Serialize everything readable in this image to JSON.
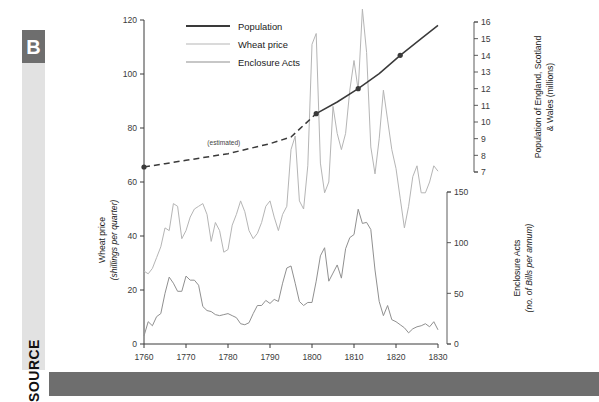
{
  "source_rail": {
    "letter": "B",
    "word": "SOURCE"
  },
  "colors": {
    "population": "#3a3a3a",
    "wheat": "#b5b5b5",
    "enclosure": "#909090",
    "rail_bg": "#e2e2e2",
    "rail_letter_bg": "#6e6e6e",
    "bottom_bar": "#6e6e6e",
    "axis": "#3a3a3a",
    "background": "#ffffff"
  },
  "legend": {
    "position": "top-left-inside",
    "items": [
      {
        "label": "Population",
        "color": "#3a3a3a"
      },
      {
        "label": "Wheat price",
        "color": "#b5b5b5"
      },
      {
        "label": "Enclosure Acts",
        "color": "#909090"
      }
    ]
  },
  "annotations": [
    {
      "name": "estimated-note",
      "text": "(estimated)",
      "x": 1779,
      "axis": "population"
    }
  ],
  "axes": {
    "x": {
      "label": "",
      "min": 1760,
      "max": 1830,
      "ticks": [
        1760,
        1770,
        1780,
        1790,
        1800,
        1810,
        1820,
        1830
      ],
      "tick_labels": [
        "1760",
        "1770",
        "1780",
        "1790",
        "1800",
        "1810",
        "1820",
        "1830"
      ]
    },
    "y_left": {
      "label_line1": "Wheat price",
      "label_line2": "(shillings per quarter)",
      "min": 0,
      "max": 120,
      "ticks": [
        0,
        20,
        40,
        60,
        80,
        100,
        120
      ],
      "tick_labels": [
        "0",
        "20",
        "40",
        "60",
        "80",
        "100",
        "120"
      ]
    },
    "y_right_top": {
      "label_line1": "Population of England, Scotland",
      "label_line2": "& Wales (millions)",
      "min": 7,
      "max": 16,
      "ticks": [
        7,
        8,
        9,
        10,
        11,
        12,
        13,
        14,
        15,
        16
      ],
      "tick_labels": [
        "7",
        "8",
        "9",
        "10",
        "11",
        "12",
        "13",
        "14",
        "15",
        "16"
      ]
    },
    "y_right_bottom": {
      "label_line1": "Enclosure Acts",
      "label_line2": "(no. of Bills per annum)",
      "min": 0,
      "max": 150,
      "ticks": [
        0,
        50,
        100,
        150
      ],
      "tick_labels": [
        "0",
        "50",
        "100",
        "150"
      ]
    }
  },
  "chart_data": {
    "type": "line",
    "title": "",
    "xlabel": "",
    "ylabel": "Wheat price (shillings per quarter)",
    "xlim": [
      1760,
      1830
    ],
    "ylim": [
      0,
      120
    ],
    "grid": false,
    "legend_position": "upper left",
    "series": [
      {
        "name": "Population",
        "color": "#3a3a3a",
        "axis": "y_right_top",
        "unit": "millions",
        "style": "dashed before 1801, solid after",
        "markers_at": [
          1760,
          1801,
          1811,
          1821
        ],
        "x": [
          1760,
          1765,
          1770,
          1775,
          1780,
          1785,
          1790,
          1795,
          1801,
          1806,
          1811,
          1816,
          1821,
          1826,
          1830
        ],
        "values": [
          7.3,
          7.5,
          7.7,
          7.9,
          8.1,
          8.4,
          8.7,
          9.1,
          10.5,
          11.2,
          12.0,
          12.9,
          14.0,
          15.0,
          15.8
        ]
      },
      {
        "name": "Wheat price",
        "color": "#b5b5b5",
        "axis": "y_left",
        "unit": "shillings per quarter",
        "x": [
          1760,
          1761,
          1762,
          1763,
          1764,
          1765,
          1766,
          1767,
          1768,
          1769,
          1770,
          1771,
          1772,
          1773,
          1774,
          1775,
          1776,
          1777,
          1778,
          1779,
          1780,
          1781,
          1782,
          1783,
          1784,
          1785,
          1786,
          1787,
          1788,
          1789,
          1790,
          1791,
          1792,
          1793,
          1794,
          1795,
          1796,
          1797,
          1798,
          1799,
          1800,
          1801,
          1802,
          1803,
          1804,
          1805,
          1806,
          1807,
          1808,
          1809,
          1810,
          1811,
          1812,
          1813,
          1814,
          1815,
          1816,
          1817,
          1818,
          1819,
          1820,
          1821,
          1822,
          1823,
          1824,
          1825,
          1826,
          1827,
          1828,
          1829,
          1830
        ],
        "values": [
          27,
          26,
          28,
          32,
          36,
          43,
          42,
          52,
          51,
          39,
          42,
          47,
          50,
          51,
          52,
          48,
          38,
          45,
          42,
          34,
          35,
          44,
          48,
          53,
          49,
          42,
          39,
          41,
          45,
          51,
          53,
          47,
          42,
          48,
          51,
          72,
          77,
          53,
          50,
          66,
          111,
          115,
          67,
          56,
          60,
          88,
          78,
          72,
          78,
          94,
          105,
          94,
          124,
          108,
          73,
          63,
          76,
          94,
          83,
          72,
          65,
          54,
          43,
          51,
          62,
          66,
          56,
          56,
          60,
          66,
          64
        ]
      },
      {
        "name": "Enclosure Acts",
        "color": "#909090",
        "axis": "y_right_bottom",
        "unit": "no. of Bills per annum",
        "x": [
          1760,
          1761,
          1762,
          1763,
          1764,
          1765,
          1766,
          1767,
          1768,
          1769,
          1770,
          1771,
          1772,
          1773,
          1774,
          1775,
          1776,
          1777,
          1778,
          1779,
          1780,
          1781,
          1782,
          1783,
          1784,
          1785,
          1786,
          1787,
          1788,
          1789,
          1790,
          1791,
          1792,
          1793,
          1794,
          1795,
          1796,
          1797,
          1798,
          1799,
          1800,
          1801,
          1802,
          1803,
          1804,
          1805,
          1806,
          1807,
          1808,
          1809,
          1810,
          1811,
          1812,
          1813,
          1814,
          1815,
          1816,
          1817,
          1818,
          1819,
          1820,
          1821,
          1822,
          1823,
          1824,
          1825,
          1826,
          1827,
          1828,
          1829,
          1830
        ],
        "values": [
          8,
          22,
          18,
          27,
          30,
          50,
          66,
          60,
          52,
          52,
          67,
          63,
          63,
          58,
          37,
          33,
          32,
          29,
          28,
          29,
          30,
          28,
          26,
          20,
          19,
          21,
          30,
          38,
          38,
          43,
          40,
          44,
          42,
          60,
          75,
          77,
          60,
          42,
          38,
          41,
          41,
          62,
          87,
          95,
          62,
          70,
          78,
          65,
          94,
          105,
          108,
          133,
          119,
          120,
          113,
          73,
          42,
          28,
          38,
          24,
          22,
          19,
          16,
          11,
          15,
          17,
          18,
          20,
          17,
          22,
          14
        ]
      }
    ]
  }
}
